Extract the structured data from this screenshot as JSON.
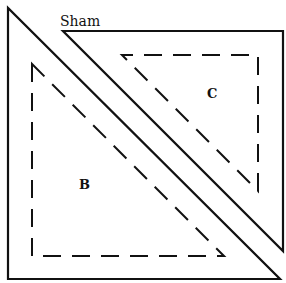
{
  "diagram": {
    "title": "Sham",
    "pieces": [
      {
        "label": "B",
        "solid": [
          [
            8,
            8
          ],
          [
            8,
            279
          ],
          [
            280,
            279
          ]
        ],
        "dashed": [
          [
            32,
            64
          ],
          [
            32,
            256
          ],
          [
            224,
            256
          ]
        ],
        "label_pos": [
          79,
          188
        ]
      },
      {
        "label": "C",
        "solid": [
          [
            63,
            31
          ],
          [
            283,
            31
          ],
          [
            283,
            251
          ]
        ],
        "dashed": [
          [
            122,
            55
          ],
          [
            258,
            55
          ],
          [
            258,
            191
          ]
        ],
        "label_pos": [
          212,
          97
        ]
      }
    ],
    "colors": {
      "line": "#111111",
      "background": "#ffffff"
    }
  }
}
